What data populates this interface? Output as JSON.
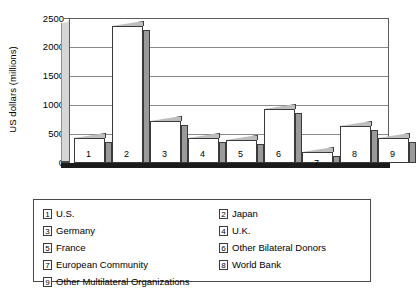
{
  "chart_data": {
    "type": "bar",
    "title": "",
    "xlabel": "",
    "ylabel": "US dollars (millions)",
    "ylim": [
      0,
      2500
    ],
    "yticks": [
      0,
      500,
      1000,
      1500,
      2000,
      2500
    ],
    "grid": true,
    "legend_position": "below-plot",
    "style": "3d-bar",
    "categories": [
      "1",
      "2",
      "3",
      "4",
      "5",
      "6",
      "7",
      "8",
      "9"
    ],
    "category_names": [
      "U.S.",
      "Japan",
      "Germany",
      "U.K.",
      "France",
      "Other Bilateral Donors",
      "European Community",
      "World Bank",
      "Other Multilateral Organizations"
    ],
    "values": [
      450,
      2430,
      750,
      450,
      400,
      950,
      200,
      650,
      450
    ],
    "series": [
      {
        "name": "Contributions",
        "values": [
          450,
          2430,
          750,
          450,
          400,
          950,
          200,
          650,
          450
        ]
      }
    ]
  },
  "axis": {
    "ylabel": "US dollars (millions)",
    "tick_2500": "2500",
    "tick_2000": "2000",
    "tick_1500": "1500",
    "tick_1000": "1000",
    "tick_500": "500",
    "tick_0": "0"
  },
  "bar_labels": {
    "b1": "1",
    "b2": "2",
    "b3": "3",
    "b4": "4",
    "b5": "5",
    "b6": "6",
    "b7": "7",
    "b8": "8",
    "b9": "9"
  },
  "legend": {
    "items": [
      {
        "key": "1",
        "label": "U.S."
      },
      {
        "key": "2",
        "label": "Japan"
      },
      {
        "key": "3",
        "label": "Germany"
      },
      {
        "key": "4",
        "label": "U.K."
      },
      {
        "key": "5",
        "label": "France"
      },
      {
        "key": "6",
        "label": "Other Bilateral Donors"
      },
      {
        "key": "7",
        "label": "European Community"
      },
      {
        "key": "8",
        "label": "World Bank"
      },
      {
        "key": "9",
        "label": "Other Multilateral Organizations"
      }
    ]
  },
  "colors": {
    "bar_front": "#ffffff",
    "bar_side": "#9a9a9a",
    "bar_top": "#bdbdbd",
    "sidewall": "#d6d6d6",
    "outline": "#3a3a3a",
    "gridline": "#8a8a8a",
    "floor": "#1b1b1b"
  }
}
